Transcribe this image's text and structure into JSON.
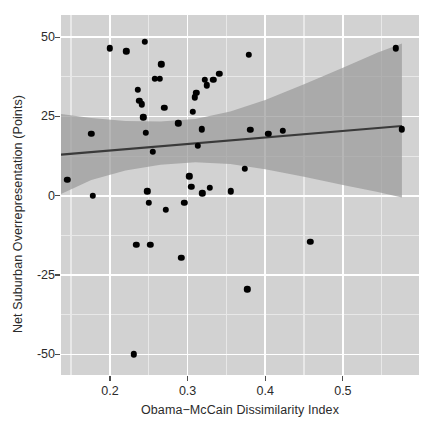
{
  "chart_data": {
    "type": "scatter",
    "title": "",
    "xlabel": "Obama−McCain Dissimilarity Index",
    "ylabel": "Net Suburban Overrepresentation (Points)",
    "xlim": [
      0.137,
      0.598
    ],
    "ylim": [
      -56.5,
      57.0
    ],
    "xticks": [
      0.2,
      0.3,
      0.4,
      0.5
    ],
    "xtick_labels": [
      "0.2",
      "0.3",
      "0.4",
      "0.5"
    ],
    "yticks": [
      -50,
      -25,
      0,
      25,
      50
    ],
    "ytick_labels": [
      "-50",
      "-25",
      "0",
      "25",
      "50"
    ],
    "xticks_minor": [
      0.15,
      0.25,
      0.35,
      0.45,
      0.55
    ],
    "yticks_minor": [
      -37.5,
      -12.5,
      12.5,
      37.5
    ],
    "grid": true,
    "legend": "none",
    "panel_background": "#d2d2d2",
    "grid_color_major": "#ffffff",
    "grid_color_minor": "#e8e8e8",
    "point_color": "#000000",
    "line_color": "#3a3a3a",
    "band_color": "#9a9a9a",
    "points": [
      {
        "x": 0.145,
        "y": 5.0
      },
      {
        "x": 0.176,
        "y": 19.5
      },
      {
        "x": 0.178,
        "y": 0.0
      },
      {
        "x": 0.2,
        "y": 46.5
      },
      {
        "x": 0.221,
        "y": 45.5
      },
      {
        "x": 0.231,
        "y": -50.0
      },
      {
        "x": 0.234,
        "y": -15.5
      },
      {
        "x": 0.236,
        "y": 33.5
      },
      {
        "x": 0.238,
        "y": 30.0
      },
      {
        "x": 0.241,
        "y": 28.8
      },
      {
        "x": 0.243,
        "y": 24.8
      },
      {
        "x": 0.245,
        "y": 48.5
      },
      {
        "x": 0.246,
        "y": 19.8
      },
      {
        "x": 0.248,
        "y": 1.4
      },
      {
        "x": 0.25,
        "y": -2.2
      },
      {
        "x": 0.252,
        "y": -15.5
      },
      {
        "x": 0.255,
        "y": 13.8
      },
      {
        "x": 0.258,
        "y": 36.8
      },
      {
        "x": 0.264,
        "y": 36.8
      },
      {
        "x": 0.266,
        "y": 41.5
      },
      {
        "x": 0.27,
        "y": 27.8
      },
      {
        "x": 0.272,
        "y": -4.5
      },
      {
        "x": 0.288,
        "y": 22.8
      },
      {
        "x": 0.292,
        "y": -19.5
      },
      {
        "x": 0.296,
        "y": -2.2
      },
      {
        "x": 0.302,
        "y": 6.2
      },
      {
        "x": 0.305,
        "y": 2.8
      },
      {
        "x": 0.307,
        "y": 26.5
      },
      {
        "x": 0.309,
        "y": 31.0
      },
      {
        "x": 0.311,
        "y": 32.5
      },
      {
        "x": 0.313,
        "y": 15.8
      },
      {
        "x": 0.318,
        "y": 21.0
      },
      {
        "x": 0.319,
        "y": 0.8
      },
      {
        "x": 0.322,
        "y": 36.5
      },
      {
        "x": 0.325,
        "y": 34.8
      },
      {
        "x": 0.329,
        "y": 2.6
      },
      {
        "x": 0.333,
        "y": 36.5
      },
      {
        "x": 0.341,
        "y": 38.5
      },
      {
        "x": 0.356,
        "y": 1.4
      },
      {
        "x": 0.374,
        "y": 8.5
      },
      {
        "x": 0.377,
        "y": -29.5
      },
      {
        "x": 0.379,
        "y": 44.5
      },
      {
        "x": 0.381,
        "y": 20.8
      },
      {
        "x": 0.404,
        "y": 19.5
      },
      {
        "x": 0.423,
        "y": 20.5
      },
      {
        "x": 0.458,
        "y": -14.5
      },
      {
        "x": 0.568,
        "y": 46.5
      },
      {
        "x": 0.576,
        "y": 21.0
      }
    ],
    "fit_line": {
      "x": [
        0.137,
        0.576
      ],
      "y": [
        13.0,
        22.0
      ]
    },
    "confidence_band": {
      "x": [
        0.137,
        0.176,
        0.22,
        0.265,
        0.31,
        0.355,
        0.4,
        0.45,
        0.5,
        0.545,
        0.576
      ],
      "upper": [
        25.8,
        24.5,
        23.6,
        23.4,
        24.2,
        26.6,
        30.2,
        35.2,
        40.4,
        45.2,
        48.0
      ],
      "lower": [
        0.6,
        5.0,
        8.0,
        9.8,
        10.6,
        10.0,
        8.4,
        6.0,
        3.4,
        1.2,
        -0.5
      ]
    }
  }
}
